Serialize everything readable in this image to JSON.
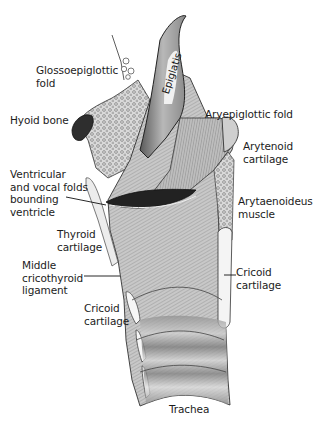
{
  "diagram": {
    "colors": {
      "background": "#ffffff",
      "ink": "#1c1c1c",
      "tissue_light": "#d6d6d6",
      "tissue_mid": "#9a9a9a",
      "tissue_dark": "#3a3a3a",
      "cartilage": "#f4f4f4"
    },
    "labels": [
      {
        "id": "glossoepiglottic-fold",
        "text": "Glossoepiglottic\nfold",
        "x": 36,
        "y": 64
      },
      {
        "id": "epiglottis",
        "text": "Epiglatis",
        "x": 165,
        "y": 98,
        "rotated": true
      },
      {
        "id": "hyoid-bone",
        "text": "Hyoid bone",
        "x": 10,
        "y": 114
      },
      {
        "id": "aryepiglottic-fold",
        "text": "Aryepiglottic fold",
        "x": 205,
        "y": 108
      },
      {
        "id": "arytenoid-cartilage",
        "text": "Arytenoid\ncartilage",
        "x": 243,
        "y": 140
      },
      {
        "id": "ventricular-vocal-folds",
        "text": "Ventricular\nand vocal folds\nbounding\nventricle",
        "x": 10,
        "y": 168
      },
      {
        "id": "arytaenoideus-muscle",
        "text": "Arytaenoideus\nmuscle",
        "x": 238,
        "y": 195
      },
      {
        "id": "thyroid-cartilage",
        "text": "Thyroid\ncartilage",
        "x": 57,
        "y": 228
      },
      {
        "id": "middle-cricothyroid-ligament",
        "text": "Middle\ncricothyroid\nligament",
        "x": 22,
        "y": 259
      },
      {
        "id": "cricoid-cartilage-right",
        "text": "Cricoid\ncartilage",
        "x": 236,
        "y": 266
      },
      {
        "id": "cricoid-cartilage-left",
        "text": "Cricoid\ncartilage",
        "x": 84,
        "y": 302
      },
      {
        "id": "trachea",
        "text": "Trachea",
        "x": 169,
        "y": 403
      }
    ],
    "leader_lines": [
      {
        "for": "ventricular-vocal-folds",
        "x1": 66,
        "y1": 197,
        "x2": 104,
        "y2": 205
      },
      {
        "for": "middle-cricothyroid-ligament",
        "x1": 84,
        "y1": 276,
        "x2": 120,
        "y2": 276
      },
      {
        "for": "cricoid-cartilage-right",
        "x1": 224,
        "y1": 275,
        "x2": 236,
        "y2": 275
      }
    ]
  }
}
